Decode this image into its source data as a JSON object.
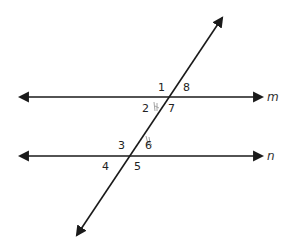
{
  "diagram": {
    "type": "parallel-lines-cut-by-transversal",
    "lines": [
      {
        "name": "m",
        "label": "m"
      },
      {
        "name": "n",
        "label": "n"
      }
    ],
    "transversal": {
      "label": ""
    },
    "angle_labels": {
      "a1": "1",
      "a2": "2",
      "a3": "3",
      "a4": "4",
      "a5": "5",
      "a6": "6",
      "a7": "7",
      "a8": "8"
    },
    "colors": {
      "line": "#1a1a1a",
      "text": "#222222",
      "pencil_mark": "#9a9a9a"
    }
  }
}
